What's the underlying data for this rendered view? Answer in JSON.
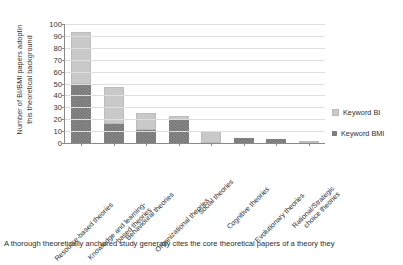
{
  "chart_data": {
    "type": "bar",
    "stacked": true,
    "title": "",
    "xlabel": "",
    "ylabel": "Number of BI/BMI papers adoptin this theoretical background",
    "ylabel_lines": [
      "Number of BI/BMI papers adoptin",
      "this theoretical background"
    ],
    "ylim": [
      0,
      100
    ],
    "yticks": [
      0,
      10,
      20,
      30,
      40,
      50,
      60,
      70,
      80,
      90,
      100
    ],
    "grid": true,
    "legend_position": "right",
    "categories": [
      "Resource-based theories",
      "Knowledge and learning-based theories",
      "Behavioural theories",
      "Organizational theories",
      "Social theories",
      "Cognitive theories",
      "Evolutionary theories",
      "Rational/Strategic choice theories"
    ],
    "category_lines": [
      [
        "Resource-based theories"
      ],
      [
        "Knowledge and learning-",
        "based theories"
      ],
      [
        "Behavioural theories"
      ],
      [
        "Organizational theories"
      ],
      [
        "Social theories"
      ],
      [
        "Cognitive theories"
      ],
      [
        "Evolutionary theories"
      ],
      [
        "Rational/Strategic",
        "choice theories"
      ]
    ],
    "series": [
      {
        "name": "Keyword BMI",
        "color": "#6e6e6e",
        "values": [
          50,
          16,
          11,
          19,
          0,
          4,
          3,
          0
        ]
      },
      {
        "name": "Keyword BI",
        "color": "#c9c9c9",
        "values": [
          43,
          31,
          14,
          4,
          10,
          0,
          0,
          2
        ]
      }
    ],
    "totals": [
      93,
      47,
      25,
      23,
      10,
      4,
      3,
      2
    ]
  },
  "legend": {
    "items": [
      {
        "label": "Keyword BI",
        "color": "#c9c9c9"
      },
      {
        "label": "Keyword BMI",
        "color": "#6e6e6e"
      }
    ]
  },
  "caption": {
    "text": "A thorough theoretically anchored study generally cites the core theoretical papers of a theory they"
  }
}
